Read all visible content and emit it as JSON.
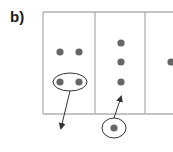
{
  "panel": {
    "label": "b)"
  },
  "colors": {
    "box_stroke": "#b0b0b0",
    "dot_fill": "#666666",
    "arrow_stroke": "#333333",
    "ellipse_stroke": "#333333",
    "background": "#ffffff"
  },
  "diagram": {
    "box": {
      "x": 43,
      "y": 12,
      "width": 140,
      "height": 102
    },
    "column_dividers_x": [
      95,
      145
    ],
    "columns": [
      {
        "name": "column-1",
        "dots": [
          {
            "cx": 60,
            "cy": 52
          },
          {
            "cx": 79,
            "cy": 52
          },
          {
            "cx": 60,
            "cy": 82
          },
          {
            "cx": 79,
            "cy": 82
          }
        ],
        "ellipse": {
          "cx": 70,
          "cy": 82,
          "rx": 17,
          "ry": 9
        },
        "arrow": {
          "x1": 70,
          "y1": 91,
          "x2": 61,
          "y2": 128,
          "direction": "out"
        }
      },
      {
        "name": "column-2",
        "dots": [
          {
            "cx": 121,
            "cy": 43
          },
          {
            "cx": 121,
            "cy": 62
          },
          {
            "cx": 121,
            "cy": 82
          }
        ],
        "incoming": {
          "dot": {
            "cx": 114,
            "cy": 128
          },
          "ellipse": {
            "cx": 114,
            "cy": 128,
            "rx": 12,
            "ry": 10
          },
          "arrow": {
            "x1": 114,
            "y1": 118,
            "x2": 121,
            "y2": 97,
            "direction": "in"
          }
        }
      },
      {
        "name": "column-3",
        "dots": [
          {
            "cx": 171,
            "cy": 62
          }
        ]
      }
    ]
  }
}
